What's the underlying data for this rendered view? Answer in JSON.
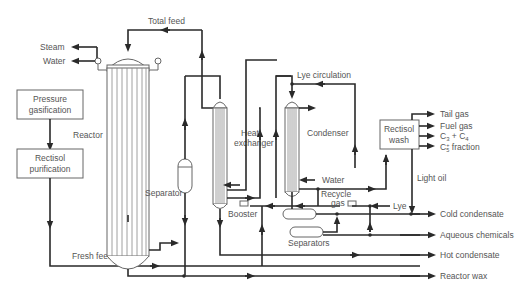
{
  "diagram": {
    "units": {
      "pressure_gasification": "Pressure gasification",
      "pressure_gasification_l1": "Pressure",
      "pressure_gasification_l2": "gasification",
      "rectisol_purification_l1": "Rectisol",
      "rectisol_purification_l2": "purification",
      "reactor": "Reactor",
      "separator": "Separator",
      "heat_exchanger_l1": "Heat",
      "heat_exchanger_l2": "exchanger",
      "condenser": "Condenser",
      "rectisol_wash_l1": "Rectisol",
      "rectisol_wash_l2": "wash",
      "booster": "Booster",
      "separators": "Separators"
    },
    "streams": {
      "total_feed": "Total feed",
      "steam": "Steam",
      "water_reactor": "Water",
      "lye_circulation": "Lye circulation",
      "water_condenser": "Water",
      "recycle_gas_l1": "Recycle",
      "recycle_gas_l2": "gas",
      "lye": "Lye",
      "light_oil": "Light oil",
      "fresh_feed": "Fresh feed"
    },
    "outputs": {
      "tail_gas": "Tail gas",
      "fuel_gas": "Fuel gas",
      "c3_c4": "C",
      "c3_sub": "3",
      "c3_plus": " + C",
      "c4_sub": "4",
      "c5": "C",
      "c5_sup": "+",
      "c5_sub": "5",
      "c5_rest": " fraction",
      "cold_condensate": "Cold condensate",
      "aqueous_chemicals": "Aqueous chemicals",
      "hot_condensate": "Hot condensate",
      "reactor_wax": "Reactor wax"
    }
  }
}
